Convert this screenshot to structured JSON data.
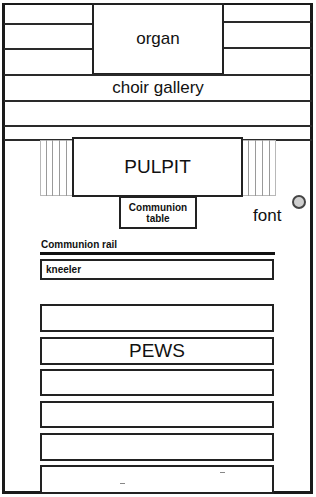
{
  "diagram": {
    "areas": {
      "organ": "organ",
      "choir_gallery": "choir gallery",
      "pulpit": "PULPIT",
      "communion_table": "Communion table",
      "font": "font",
      "communion_rail": "Communion rail",
      "kneeler": "kneeler",
      "pews": "PEWS"
    },
    "pew_rows": 6,
    "colors": {
      "line": "#222222",
      "stairs": "#9a9a9a",
      "font_fill": "#cfcfcf"
    }
  }
}
